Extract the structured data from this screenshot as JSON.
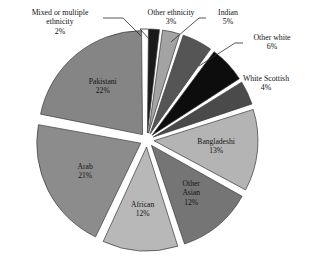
{
  "chart_data": {
    "type": "pie",
    "title": "",
    "subtitle": "",
    "xlabel": "",
    "ylabel": "",
    "legend_position": "none",
    "grid": false,
    "value_unit": "percent",
    "total": 100,
    "categories": [
      "Mixed or multiple ethnicity",
      "Other ethnicity",
      "Indian",
      "Other white",
      "White Scottish",
      "Bangladeshi",
      "Other Asian",
      "African",
      "Arab",
      "Pakistani"
    ],
    "values": [
      2,
      3,
      5,
      6,
      4,
      13,
      12,
      12,
      21,
      22
    ],
    "slices": [
      {
        "label": "Mixed or multiple ethnicity",
        "label_line1": "Mixed or multiple",
        "label_line2": "ethnicity",
        "value": 2,
        "value_text": "2%",
        "color": "#1a1a1a",
        "label_placement": "outside"
      },
      {
        "label": "Other ethnicity",
        "label_line1": "Other ethnicity",
        "label_line2": "",
        "value": 3,
        "value_text": "3%",
        "color": "#a3a3a3",
        "label_placement": "outside"
      },
      {
        "label": "Indian",
        "label_line1": "Indian",
        "label_line2": "",
        "value": 5,
        "value_text": "5%",
        "color": "#555555",
        "label_placement": "outside"
      },
      {
        "label": "Other white",
        "label_line1": "Other white",
        "label_line2": "",
        "value": 6,
        "value_text": "6%",
        "color": "#0d0d0d",
        "label_placement": "outside"
      },
      {
        "label": "White Scottish",
        "label_line1": "White Scottish",
        "label_line2": "",
        "value": 4,
        "value_text": "4%",
        "color": "#4a4a4a",
        "label_placement": "outside"
      },
      {
        "label": "Bangladeshi",
        "label_line1": "Bangladeshi",
        "label_line2": "",
        "value": 13,
        "value_text": "13%",
        "color": "#b4b4b4",
        "label_placement": "inside"
      },
      {
        "label": "Other Asian",
        "label_line1": "Other",
        "label_line2": "Asian",
        "value": 12,
        "value_text": "12%",
        "color": "#757575",
        "label_placement": "inside"
      },
      {
        "label": "African",
        "label_line1": "African",
        "label_line2": "",
        "value": 12,
        "value_text": "12%",
        "color": "#b8b8b8",
        "label_placement": "inside"
      },
      {
        "label": "Arab",
        "label_line1": "Arab",
        "label_line2": "",
        "value": 21,
        "value_text": "21%",
        "color": "#8c8c8c",
        "label_placement": "inside"
      },
      {
        "label": "Pakistani",
        "label_line1": "Pakistani",
        "label_line2": "",
        "value": 22,
        "value_text": "22%",
        "color": "#858585",
        "label_placement": "inside"
      }
    ]
  },
  "callouts": {
    "mixed": {
      "line1": "Mixed or multiple",
      "line2": "ethnicity",
      "pct": "2%"
    },
    "other_ethnicity": {
      "line1": "Other ethnicity",
      "pct": "3%"
    },
    "indian": {
      "line1": "Indian",
      "pct": "5%"
    },
    "other_white": {
      "line1": "Other white",
      "pct": "6%"
    },
    "white_scottish": {
      "line1": "White Scottish",
      "pct": "4%"
    }
  },
  "inside_labels": {
    "bangladeshi": {
      "line1": "Bangladeshi",
      "pct": "13%"
    },
    "other_asian": {
      "line1": "Other",
      "line2": "Asian",
      "pct": "12%"
    },
    "african": {
      "line1": "African",
      "pct": "12%"
    },
    "arab": {
      "line1": "Arab",
      "pct": "21%"
    },
    "pakistani": {
      "line1": "Pakistani",
      "pct": "22%"
    }
  }
}
